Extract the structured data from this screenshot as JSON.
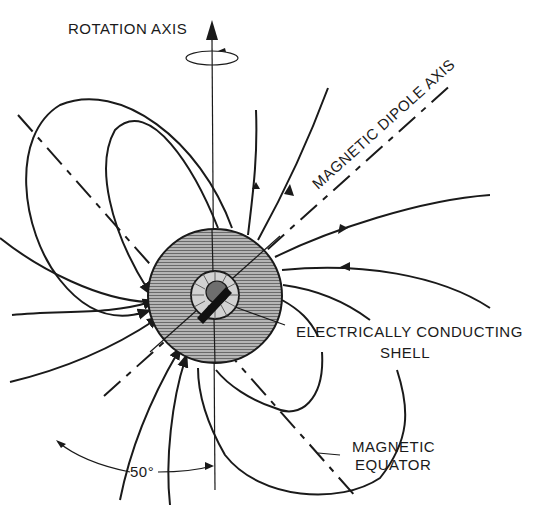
{
  "diagram": {
    "type": "magnetic dipole field diagram",
    "labels": {
      "rotation_axis": "ROTATION AXIS",
      "dipole_axis": "MAGNETIC DIPOLE AXIS",
      "shell_line1": "ELECTRICALLY CONDUCTING",
      "shell_line2": "SHELL",
      "equator_line1": "MAGNETIC",
      "equator_line2": "EQUATOR",
      "angle": "50°"
    },
    "tilt_angle_deg": 50,
    "colors": {
      "ink": "#1a1a1a",
      "planet_fill": "#9a9a9a",
      "shell_fill": "#c8c8c8",
      "core_fill": "#6e6e6e",
      "background": "#ffffff"
    },
    "components": [
      "rotation axis with rotation arrow",
      "magnetic dipole axis (dash-dot)",
      "magnetic equator (dash-dot)",
      "planet body",
      "electrically conducting shell",
      "dipole magnet",
      "magnetic field lines"
    ]
  }
}
